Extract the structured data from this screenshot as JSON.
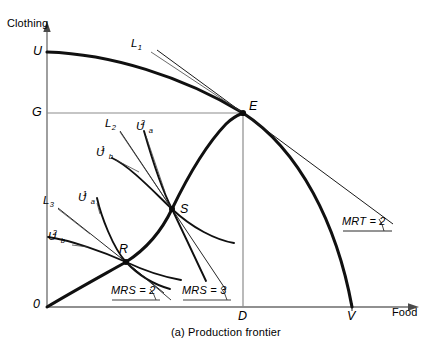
{
  "figure": {
    "caption": "(a)  Production frontier",
    "axes": {
      "y_title": "Clothing",
      "x_title": "Food",
      "origin_label": "0"
    },
    "points": [
      {
        "id": "U",
        "label": "U",
        "x": 47,
        "y": 52,
        "note": "clothing-intercept of production frontier"
      },
      {
        "id": "G",
        "label": "G",
        "x": 47,
        "y": 113,
        "note": "clothing level at efficient point E"
      },
      {
        "id": "E",
        "label": "E",
        "x": 243,
        "y": 113,
        "note": "production point on frontier"
      },
      {
        "id": "S",
        "label": "S",
        "x": 172,
        "y": 209,
        "note": "tangency of Ua2 and Ub1"
      },
      {
        "id": "R",
        "label": "R",
        "x": 126,
        "y": 262,
        "note": "tangency of Ua1 and Ub2"
      },
      {
        "id": "D",
        "label": "D",
        "x": 243,
        "y": 307,
        "note": "food level at efficient point E"
      },
      {
        "id": "V",
        "label": "V",
        "x": 352,
        "y": 307,
        "note": "food-intercept of production frontier"
      }
    ],
    "budget_lines": [
      {
        "id": "L1",
        "label": "L",
        "sub": "1",
        "tangent_at": "E"
      },
      {
        "id": "L2",
        "label": "L",
        "sub": "2",
        "tangent_at": "S"
      },
      {
        "id": "L3",
        "label": "L",
        "sub": "3",
        "tangent_at": "R"
      }
    ],
    "indifference_curves": [
      {
        "id": "Ua2",
        "label": "U",
        "sub": "a",
        "sup": "2",
        "through": "S"
      },
      {
        "id": "Ub1",
        "label": "U",
        "sub": "b",
        "sup": "1",
        "through": "S"
      },
      {
        "id": "Ua1",
        "label": "U",
        "sub": "a",
        "sup": "1",
        "through": "R"
      },
      {
        "id": "Ub2",
        "label": "U",
        "sub": "b",
        "sup": "2",
        "through": "R"
      }
    ],
    "rate_labels": [
      {
        "id": "mrs-at-R",
        "text": "MRS = 2",
        "at_point": "R"
      },
      {
        "id": "mrs-at-S",
        "text": "MRS = 3",
        "at_point": "S"
      },
      {
        "id": "mrt-at-E",
        "text": "MRT = 2",
        "at_point": "E"
      }
    ],
    "colors": {
      "ink": "#000000",
      "curve": "#1a1a1a",
      "grid": "#8c8c8c",
      "axis": "#555555",
      "background": "#ffffff"
    }
  }
}
